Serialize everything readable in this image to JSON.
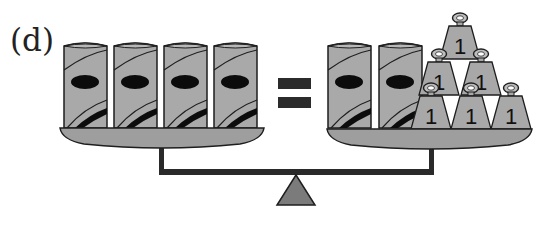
{
  "figure": {
    "label": "(d)",
    "colors": {
      "can_fill": "#a9a9a9",
      "pan_fill": "#9e9e9e",
      "weight_fill": "#a8a8a8",
      "outline": "#1e1e1e",
      "beam": "#2a2a2a",
      "fulcrum_fill": "#7b7b7b",
      "equals": "#2b2b2b"
    }
  },
  "left_side": {
    "cans": [
      {
        "id": "can-1"
      },
      {
        "id": "can-2"
      },
      {
        "id": "can-3"
      },
      {
        "id": "can-4"
      }
    ],
    "can_count": 4
  },
  "operator": "=",
  "right_side": {
    "cans": [
      {
        "id": "can-5"
      },
      {
        "id": "can-6"
      }
    ],
    "can_count": 2,
    "weights": [
      {
        "value": "1",
        "row": "top"
      },
      {
        "value": "1",
        "row": "middle"
      },
      {
        "value": "1",
        "row": "middle"
      },
      {
        "value": "1",
        "row": "bottom"
      },
      {
        "value": "1",
        "row": "bottom"
      },
      {
        "value": "1",
        "row": "bottom"
      }
    ],
    "weight_count": 6
  }
}
